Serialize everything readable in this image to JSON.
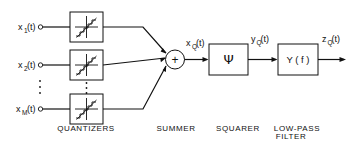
{
  "figure": {
    "type": "block-diagram",
    "title": "",
    "background_color": "#ffffff",
    "stroke_color": "#111111"
  },
  "inputs": [
    {
      "base": "x",
      "sub": "1",
      "arg": "(t)",
      "full": "x₁(t)"
    },
    {
      "base": "x",
      "sub": "2",
      "arg": "(t)",
      "full": "x₂(t)"
    },
    {
      "base": "x",
      "sub": "M",
      "arg": "(t)",
      "full": "x_M(t)"
    }
  ],
  "signals": {
    "summer_out": {
      "base": "x",
      "sub": "Q",
      "arg": "(t)"
    },
    "squarer_out": {
      "base": "y",
      "sub": "Q",
      "arg": "(t)"
    },
    "filter_out": {
      "base": "z",
      "sub": "Q",
      "arg": "(t)"
    }
  },
  "blocks": {
    "quantizer": {
      "symbol": "staircase",
      "count": 3
    },
    "summer": {
      "symbol": "+"
    },
    "squarer": {
      "symbol": "Ψ"
    },
    "lowpass": {
      "symbol": "Y ( f )"
    }
  },
  "captions": {
    "quantizers": "QUANTIZERS",
    "summer": "SUMMER",
    "squarer": "SQUARER",
    "lowpass_line1": "LOW-PASS",
    "lowpass_line2": "FILTER"
  },
  "ellipsis": {
    "glyph": "⋮"
  }
}
